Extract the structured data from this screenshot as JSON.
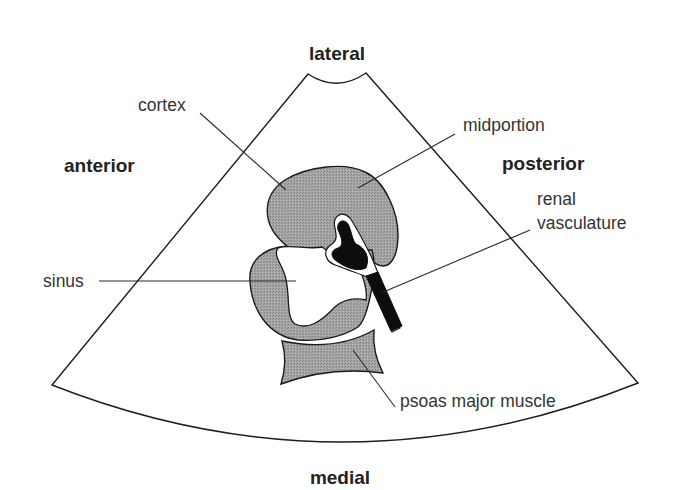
{
  "figure": {
    "type": "ultrasound schematic",
    "colors": {
      "background": "#ffffff",
      "outline": "#1e1e1e",
      "tissue_fill": "#9c9c9c",
      "vessel_fill": "#0d0d0d",
      "text": "#2a2a2a"
    }
  },
  "orientation_labels": {
    "top": "lateral",
    "bottom": "medial",
    "left": "anterior",
    "right": "posterior"
  },
  "annotations": {
    "cortex": "cortex",
    "midportion": "midportion",
    "renal_vasculature_line1": "renal",
    "renal_vasculature_line2": "vasculature",
    "sinus": "sinus",
    "psoas": "psoas major muscle"
  }
}
